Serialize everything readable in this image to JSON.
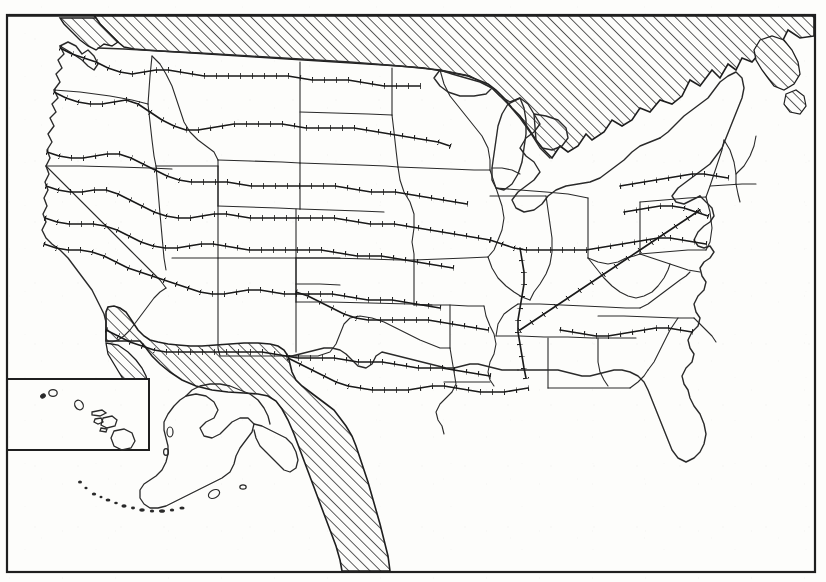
{
  "document": {
    "kind": "scanned-map",
    "region": "United States",
    "has_text_labels": false,
    "background_color": "#fdfdfb",
    "ink_color": "#1a1a1a"
  },
  "frame": {
    "name": "map-border",
    "x": 7,
    "y": 15,
    "width": 808,
    "height": 557,
    "stroke_width": 2.2,
    "color": "#1f1f1f"
  },
  "insets": [
    {
      "name": "hawaii-inset",
      "label": "Hawaii",
      "x": 7,
      "y": 379,
      "width": 142,
      "height": 71,
      "stroke_width": 2.0,
      "color": "#1f1f1f"
    },
    {
      "name": "alaska-inset",
      "label": "Alaska",
      "boxed": false
    }
  ],
  "legend_note": {
    "hatch_meaning": "foreign territory / water (Canada, Mexico, ocean)",
    "hachure_meaning": "isoline with tick marks on one side"
  },
  "hatch": {
    "name": "diagonal-hatch-pattern",
    "angle_degrees": 45,
    "direction": "lower-left to upper-right",
    "spacing_px": 7.5,
    "stroke_width": 1.5,
    "color": "#262626"
  },
  "hachure": {
    "name": "hachured-isoline",
    "tick_length_px": 6,
    "tick_spacing_px": 12,
    "stroke_width": 1.6,
    "color": "#1a1a1a"
  },
  "boundaries": {
    "state_line_width": 1.1,
    "coast_line_width": 1.4,
    "color": "#2a2a2a"
  },
  "chart_data": {
    "type": "map",
    "title": "",
    "projection": "albers-like-conic",
    "regions_hatched": [
      {
        "name": "canada",
        "description": "Canada, hatched band across the entire northern edge"
      },
      {
        "name": "mexico",
        "description": "Mexico and Baja California, hatched wedge in the south-west and along the Gulf to the bottom edge"
      },
      {
        "name": "maritimes",
        "description": "Nova Scotia / New Brunswick, hatched at the north-east corner"
      }
    ],
    "isoline_count": 12,
    "isoline_orientation": "predominantly east-west, bending south over the Rockies and Appalachians",
    "insets_shown": [
      "Alaska",
      "Hawaii"
    ],
    "states_outlined": 48
  }
}
